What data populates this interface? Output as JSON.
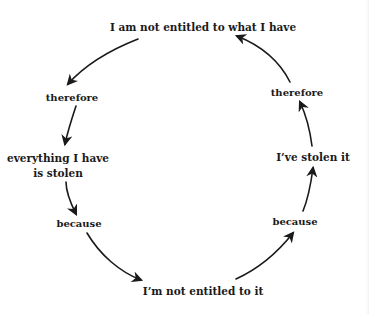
{
  "diagram": {
    "type": "cycle",
    "nodes": [
      {
        "id": "top",
        "text": "I am not entitled to what I have"
      },
      {
        "id": "left-therefore",
        "text": "therefore"
      },
      {
        "id": "left-claim-line1",
        "text": "everything I have"
      },
      {
        "id": "left-claim-line2",
        "text": "is stolen"
      },
      {
        "id": "left-because",
        "text": "because"
      },
      {
        "id": "bottom",
        "text": "I’m not entitled to it"
      },
      {
        "id": "right-because",
        "text": "because"
      },
      {
        "id": "right-claim",
        "text": "I’ve stolen it"
      },
      {
        "id": "right-therefore",
        "text": "therefore"
      }
    ],
    "edges": [
      {
        "from": "top",
        "to": "left-therefore"
      },
      {
        "from": "left-therefore",
        "to": "left-claim"
      },
      {
        "from": "left-claim",
        "to": "left-because"
      },
      {
        "from": "left-because",
        "to": "bottom"
      },
      {
        "from": "bottom",
        "to": "right-because"
      },
      {
        "from": "right-because",
        "to": "right-claim"
      },
      {
        "from": "right-claim",
        "to": "right-therefore"
      },
      {
        "from": "right-therefore",
        "to": "top"
      }
    ],
    "colors": {
      "text": "#1a1a1a",
      "arrow": "#1a1a1a",
      "background": "#ffffff"
    }
  }
}
